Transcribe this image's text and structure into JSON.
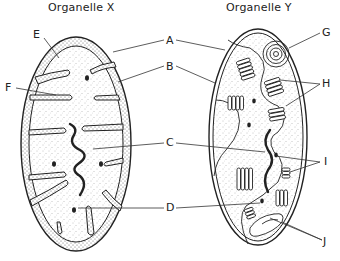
{
  "titles": {
    "left": "Organelle X",
    "right": "Organelle Y"
  },
  "labels": {
    "A": "A",
    "B": "B",
    "C": "C",
    "D": "D",
    "E": "E",
    "F": "F",
    "G": "G",
    "H": "H",
    "I": "I",
    "J": "J"
  },
  "organelles": [
    {
      "id": "X",
      "depicts": "mitochondrion-like organelle",
      "parts": [
        "E",
        "F",
        "A",
        "B",
        "C",
        "D"
      ]
    },
    {
      "id": "Y",
      "depicts": "chloroplast-like organelle",
      "parts": [
        "A",
        "B",
        "C",
        "D",
        "G",
        "H",
        "I",
        "J"
      ]
    }
  ],
  "colors": {
    "ink": "#222222",
    "stipple": "#8a8a8a",
    "background": "#ffffff"
  }
}
